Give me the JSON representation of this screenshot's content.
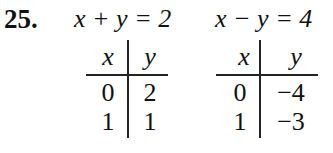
{
  "problem": {
    "number": "25.",
    "equations": [
      {
        "text": "x + y = 2",
        "table": {
          "headers": [
            "x",
            "y"
          ],
          "rows": [
            [
              "0",
              "2"
            ],
            [
              "1",
              "1"
            ]
          ]
        }
      },
      {
        "text": "x − y = 4",
        "table": {
          "headers": [
            "x",
            "y"
          ],
          "rows": [
            [
              "0",
              "−4"
            ],
            [
              "1",
              "−3"
            ]
          ]
        }
      }
    ]
  }
}
